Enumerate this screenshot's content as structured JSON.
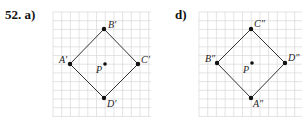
{
  "problem": {
    "number": "52.",
    "parts": [
      {
        "label": "a)",
        "center": {
          "name": "P",
          "x": 105,
          "y": 64
        },
        "vertices": [
          {
            "name": "A′",
            "x": 70,
            "y": 64,
            "lx": 59,
            "ly": 63
          },
          {
            "name": "B′",
            "x": 104,
            "y": 29,
            "lx": 108,
            "ly": 28
          },
          {
            "name": "C′",
            "x": 138,
            "y": 64,
            "lx": 141,
            "ly": 63
          },
          {
            "name": "D′",
            "x": 104,
            "y": 98,
            "lx": 107,
            "ly": 107
          }
        ],
        "p_label": {
          "x": 96,
          "y": 73
        },
        "grid": {
          "x0": 53,
          "y0": 12,
          "x1": 151,
          "y1": 117,
          "step": 8.7
        }
      },
      {
        "label": "d)",
        "center": {
          "name": "P",
          "x": 252,
          "y": 63
        },
        "vertices": [
          {
            "name": "B″",
            "x": 217,
            "y": 63,
            "lx": 205,
            "ly": 62
          },
          {
            "name": "C″",
            "x": 251,
            "y": 29,
            "lx": 254,
            "ly": 27
          },
          {
            "name": "D″",
            "x": 285,
            "y": 63,
            "lx": 288,
            "ly": 61
          },
          {
            "name": "A″",
            "x": 251,
            "y": 98,
            "lx": 253,
            "ly": 107
          }
        ],
        "p_label": {
          "x": 243,
          "y": 73
        },
        "grid": {
          "x0": 199,
          "y0": 12,
          "x1": 302,
          "y1": 117,
          "step": 8.7
        }
      }
    ]
  },
  "colors": {
    "grid": "#d9d9d9",
    "line": "#333333",
    "point": "#111111"
  }
}
